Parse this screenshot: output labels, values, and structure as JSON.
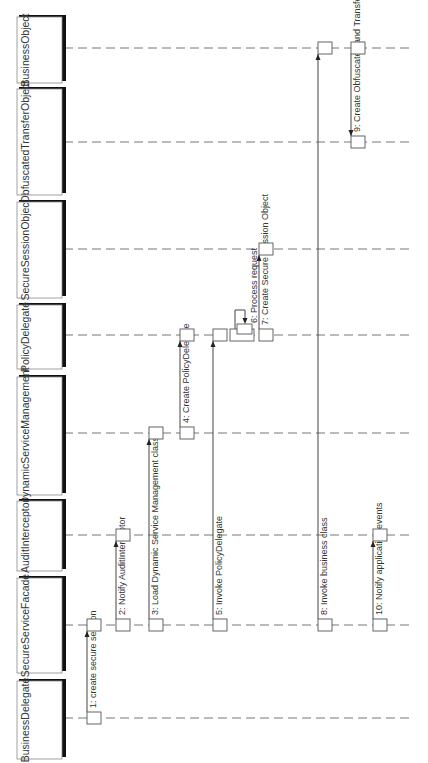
{
  "diagram": {
    "type": "uml-sequence-diagram",
    "orientation": "rotated-90-ccw",
    "lifelines": [
      {
        "id": "BusinessObject",
        "label": "BusinessObject"
      },
      {
        "id": "ObfuscatedTransferObject",
        "label": "ObfuscatedTransferObject"
      },
      {
        "id": "SecureSessionObject",
        "label": "SecureSessionObject"
      },
      {
        "id": "PolicyDelegate",
        "label": "PolicyDelegate"
      },
      {
        "id": "DynamicServiceManagement",
        "label": "DynamicServiceManagement"
      },
      {
        "id": "AuditInterceptor",
        "label": "AuditInterceptor"
      },
      {
        "id": "SecureServiceFacade",
        "label": "SecureServiceFacade"
      },
      {
        "id": "BusinessDelegate",
        "label": "BusinessDelegate"
      }
    ],
    "messages": [
      {
        "seq": 1,
        "label": "1: create secure session",
        "from": "BusinessDelegate",
        "to": "SecureServiceFacade"
      },
      {
        "seq": 2,
        "label": "2: Notify AuditInterceptor",
        "from": "SecureServiceFacade",
        "to": "AuditInterceptor"
      },
      {
        "seq": 3,
        "label": "3: Load Dynamic Service Management class",
        "from": "SecureServiceFacade",
        "to": "DynamicServiceManagement"
      },
      {
        "seq": 4,
        "label": "4: Create PolicyDelegate",
        "from": "DynamicServiceManagement",
        "to": "PolicyDelegate"
      },
      {
        "seq": 5,
        "label": "5: Invoke PolicyDelegate",
        "from": "SecureServiceFacade",
        "to": "PolicyDelegate"
      },
      {
        "seq": 6,
        "label": "6: Process request",
        "from": "PolicyDelegate",
        "to": "PolicyDelegate",
        "self": true
      },
      {
        "seq": 7,
        "label": "7: Create Secure Session Object",
        "from": "PolicyDelegate",
        "to": "SecureSessionObject"
      },
      {
        "seq": 8,
        "label": "8: Invoke business class",
        "from": "SecureServiceFacade",
        "to": "BusinessObject"
      },
      {
        "seq": 9,
        "label": "9: Create Obfuscated and Transfer Object",
        "from": "BusinessObject",
        "to": "ObfuscatedTransferObject"
      },
      {
        "seq": 10,
        "label": "10: Notify application events",
        "from": "SecureServiceFacade",
        "to": "AuditInterceptor"
      }
    ]
  }
}
